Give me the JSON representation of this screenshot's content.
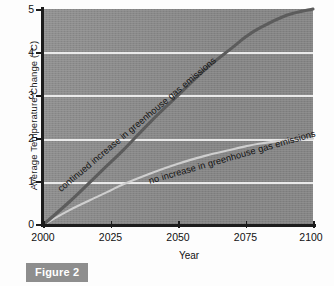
{
  "figure": {
    "caption": "Figure 2"
  },
  "chart_data": {
    "type": "line",
    "title": "",
    "xlabel": "Year",
    "ylabel": "Average Temperature Change (°C)",
    "xlim": [
      2000,
      2100
    ],
    "ylim": [
      0,
      5
    ],
    "xticks": [
      "2000",
      "2025",
      "2050",
      "2075",
      "2100"
    ],
    "yticks": [
      "0",
      "1",
      "2",
      "3",
      "4",
      "5"
    ],
    "grid": true,
    "grid_color": "#f2f2f2",
    "plot_background": "#8b8b8b",
    "legend_position": "inline-curve-labels",
    "x": [
      2000,
      2010,
      2020,
      2025,
      2030,
      2040,
      2050,
      2060,
      2070,
      2075,
      2080,
      2090,
      2100
    ],
    "series": [
      {
        "name": "continued increase in greenhouse gas emissions",
        "color": "#5c5c5c",
        "values": [
          0.0,
          0.55,
          1.15,
          1.45,
          1.75,
          2.4,
          3.0,
          3.6,
          4.1,
          4.35,
          4.55,
          4.85,
          5.0
        ]
      },
      {
        "name": "no increase in greenhouse gas emissions",
        "color": "#cfcfcf",
        "values": [
          0.0,
          0.35,
          0.65,
          0.8,
          0.95,
          1.2,
          1.42,
          1.6,
          1.75,
          1.82,
          1.88,
          1.96,
          2.0
        ]
      }
    ],
    "annotations": [
      {
        "text": "continued increase in greenhouse gas emissions",
        "attached_to": "continued increase in greenhouse gas emissions",
        "rotation": -40
      },
      {
        "text": "no increase in greenhouse gas emissions",
        "attached_to": "no increase in greenhouse gas emissions",
        "rotation": -16
      }
    ]
  }
}
